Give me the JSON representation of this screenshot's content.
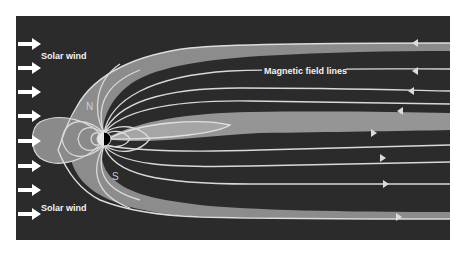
{
  "figure": {
    "labels": {
      "solar_wind_top": "Solar wind",
      "solar_wind_bottom": "Solar wind",
      "magnetic_field_lines": "Magnetic field lines",
      "north_pole": "N",
      "south_pole": "S"
    },
    "solar_wind_arrows": {
      "count": 8,
      "direction": "right",
      "y_positions": [
        44,
        68,
        92,
        116,
        141,
        166,
        190,
        214
      ]
    },
    "earth": {
      "day_side": "left (lit)",
      "night_side": "right (dark)"
    },
    "field_line_arrows": {
      "upper_lines_direction": "left",
      "lower_lines_direction": "right"
    },
    "colors": {
      "background": "#2b2b2b",
      "magnetosheath": "#8e8e8e",
      "field_lines": "#d9d9d9",
      "text": "#f2f2f2",
      "page": "#ffffff"
    }
  }
}
